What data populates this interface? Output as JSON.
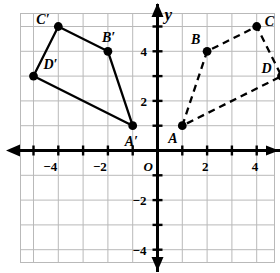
{
  "figure": {
    "axis_labels": {
      "y": "y",
      "origin": "O"
    },
    "colors": {
      "grid": "#b9b9b9",
      "axis": "#000000",
      "point": "#000000",
      "preimage_stroke": "#000000",
      "image_stroke": "#000000"
    }
  },
  "chart_data": {
    "type": "scatter",
    "title": "",
    "xlabel": "",
    "ylabel": "y",
    "xlim": [
      -5.6,
      5.6
    ],
    "ylim": [
      -5.6,
      5.6
    ],
    "grid": true,
    "legend": "none",
    "x_ticks": [
      {
        "value": -4,
        "label": "−4"
      },
      {
        "value": -2,
        "label": "−2"
      },
      {
        "value": 2,
        "label": "2"
      },
      {
        "value": 4,
        "label": "4"
      }
    ],
    "y_ticks": [
      {
        "value": 4,
        "label": "4"
      },
      {
        "value": 2,
        "label": "2"
      },
      {
        "value": -2,
        "label": "−2"
      },
      {
        "value": -4,
        "label": "−4"
      }
    ],
    "series": [
      {
        "name": "ABCD",
        "style": "dashed",
        "closed": true,
        "points": [
          {
            "label": "A",
            "x": 1,
            "y": 1,
            "label_dx": -14,
            "label_dy": 6
          },
          {
            "label": "B",
            "x": 2,
            "y": 4,
            "label_dx": -16,
            "label_dy": -18
          },
          {
            "label": "C",
            "x": 4,
            "y": 5,
            "label_dx": 8,
            "label_dy": -12
          },
          {
            "label": "D",
            "x": 5,
            "y": 3,
            "label_dx": -20,
            "label_dy": -14
          }
        ]
      },
      {
        "name": "A'B'C'D'",
        "style": "solid",
        "closed": true,
        "points": [
          {
            "label": "A′",
            "x": -1,
            "y": 1,
            "label_dx": -8,
            "label_dy": 9
          },
          {
            "label": "B′",
            "x": -2,
            "y": 4,
            "label_dx": -6,
            "label_dy": -20
          },
          {
            "label": "C′",
            "x": -4,
            "y": 5,
            "label_dx": -22,
            "label_dy": -14
          },
          {
            "label": "D′",
            "x": -5,
            "y": 3,
            "label_dx": 10,
            "label_dy": -18
          }
        ]
      }
    ]
  }
}
